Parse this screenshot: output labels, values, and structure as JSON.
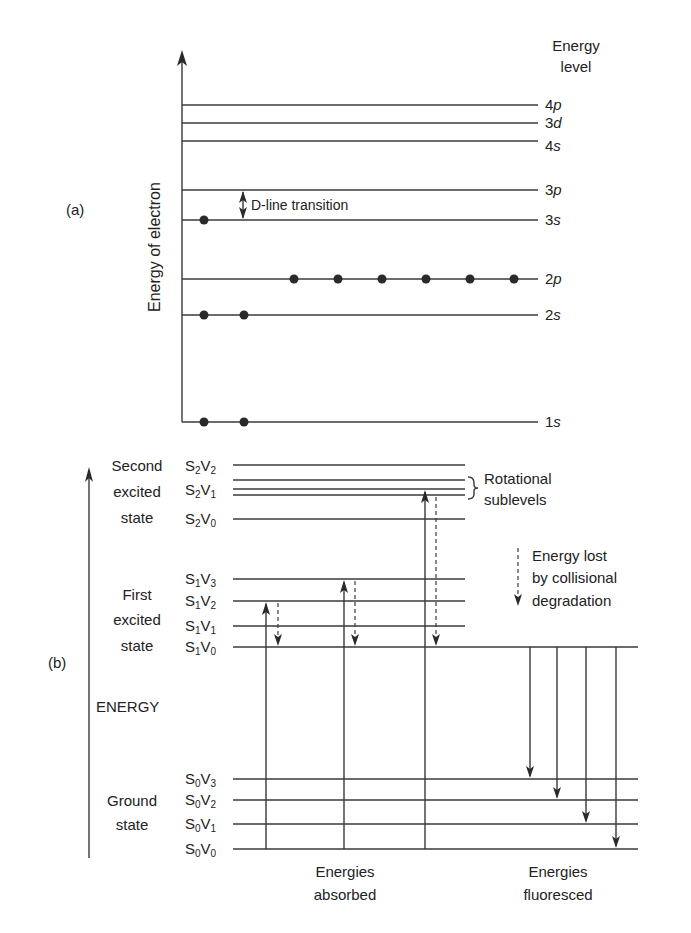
{
  "panel_a": {
    "label": "(a)",
    "y_axis_label": "Energy of electron",
    "column_header_line1": "Energy",
    "column_header_line2": "level",
    "levels": [
      {
        "num": "4",
        "orb": "p",
        "electrons": 0
      },
      {
        "num": "3",
        "orb": "d",
        "electrons": 0
      },
      {
        "num": "4",
        "orb": "s",
        "electrons": 0
      },
      {
        "num": "3",
        "orb": "p",
        "electrons": 0
      },
      {
        "num": "3",
        "orb": "s",
        "electrons": 1
      },
      {
        "num": "2",
        "orb": "p",
        "electrons": 6
      },
      {
        "num": "2",
        "orb": "s",
        "electrons": 2
      },
      {
        "num": "1",
        "orb": "s",
        "electrons": 2
      }
    ],
    "transition_label": "D-line transition"
  },
  "panel_b": {
    "label": "(b)",
    "axis_label": "ENERGY",
    "states": [
      {
        "line1": "Second",
        "line2": "excited",
        "line3": "state"
      },
      {
        "line1": "First",
        "line2": "excited",
        "line3": "state"
      },
      {
        "line1": "Ground",
        "line2": "state"
      }
    ],
    "levels": [
      {
        "S": "2",
        "V": "2"
      },
      {
        "S": "2",
        "V": "1"
      },
      {
        "S": "2",
        "V": "0"
      },
      {
        "S": "1",
        "V": "3"
      },
      {
        "S": "1",
        "V": "2"
      },
      {
        "S": "1",
        "V": "1"
      },
      {
        "S": "1",
        "V": "0"
      },
      {
        "S": "0",
        "V": "3"
      },
      {
        "S": "0",
        "V": "2"
      },
      {
        "S": "0",
        "V": "1"
      },
      {
        "S": "0",
        "V": "0"
      }
    ],
    "rotational_label_line1": "Rotational",
    "rotational_label_line2": "sublevels",
    "legend_line1": "Energy lost",
    "legend_line2": "by collisional",
    "legend_line3": "degradation",
    "absorbed_line1": "Energies",
    "absorbed_line2": "absorbed",
    "fluoresced_line1": "Energies",
    "fluoresced_line2": "fluoresced"
  }
}
